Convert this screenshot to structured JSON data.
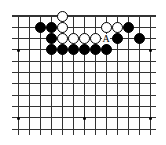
{
  "board": {
    "cols": 13,
    "rows": 11,
    "origin_x": 18,
    "origin_y": 16,
    "spacing_x": 11,
    "spacing_y": 11.3,
    "top_edge": true,
    "colors": {
      "black": "#000000",
      "white": "#ffffff",
      "line": "#333333",
      "background": "#ffffff"
    },
    "star_points": [
      [
        0,
        3
      ],
      [
        12,
        3
      ],
      [
        0,
        9
      ],
      [
        6,
        9
      ],
      [
        12,
        9
      ]
    ],
    "stones": [
      {
        "color": "white",
        "col": 4,
        "row": 0
      },
      {
        "color": "black",
        "col": 2,
        "row": 1
      },
      {
        "color": "black",
        "col": 3,
        "row": 1
      },
      {
        "color": "white",
        "col": 4,
        "row": 1
      },
      {
        "color": "white",
        "col": 8,
        "row": 1
      },
      {
        "color": "white",
        "col": 9,
        "row": 1
      },
      {
        "color": "black",
        "col": 10,
        "row": 1
      },
      {
        "color": "black",
        "col": 3,
        "row": 2
      },
      {
        "color": "white",
        "col": 4,
        "row": 2
      },
      {
        "color": "white",
        "col": 5,
        "row": 2
      },
      {
        "color": "white",
        "col": 6,
        "row": 2
      },
      {
        "color": "white",
        "col": 7,
        "row": 2
      },
      {
        "color": "black",
        "col": 9,
        "row": 2
      },
      {
        "color": "black",
        "col": 11,
        "row": 2
      },
      {
        "color": "black",
        "col": 3,
        "row": 3
      },
      {
        "color": "black",
        "col": 4,
        "row": 3
      },
      {
        "color": "black",
        "col": 5,
        "row": 3
      },
      {
        "color": "black",
        "col": 6,
        "row": 3
      },
      {
        "color": "black",
        "col": 7,
        "row": 3
      },
      {
        "color": "black",
        "col": 8,
        "row": 3
      }
    ],
    "labels": [
      {
        "text": "A",
        "col": 8,
        "row": 2
      }
    ]
  }
}
